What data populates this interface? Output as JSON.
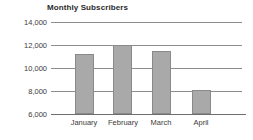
{
  "chart_data": {
    "type": "bar",
    "title": "Monthly Subscribers",
    "xlabel": "",
    "ylabel": "",
    "categories": [
      "January",
      "February",
      "March",
      "April"
    ],
    "values": [
      11200,
      12000,
      11500,
      8100
    ],
    "ylim": [
      6000,
      14000
    ],
    "yticks": [
      14000,
      12000,
      10000,
      8000,
      6000
    ],
    "ytick_labels": [
      "14,000",
      "12,000",
      "10,000",
      "8,000",
      "6,000"
    ],
    "grid": true,
    "legend": false,
    "series": [
      {
        "name": "Subscribers",
        "values": [
          11200,
          12000,
          11500,
          8100
        ],
        "color": "#a9a9a9"
      }
    ]
  },
  "colors": {
    "bar_fill": "#a9a9a9",
    "bar_border": "#8a8a8a",
    "gridline": "#8d8d8d",
    "axis": "#6e6e6e",
    "text": "#3a3a3a",
    "title": "#2b2b2b",
    "background": "#ffffff"
  }
}
